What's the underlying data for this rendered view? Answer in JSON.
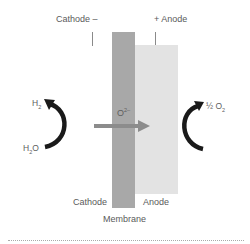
{
  "diagram": {
    "top_labels": {
      "cathode": "Cathode –",
      "anode": "+  Anode"
    },
    "bottom_labels": {
      "cathode": "Cathode",
      "anode": "Anode",
      "membrane": "Membrane"
    },
    "ion": {
      "base": "O",
      "charge": "2–"
    },
    "left_reaction": {
      "product_base": "H",
      "product_sub": "2",
      "reactant_base": "H",
      "reactant_sub": "2",
      "reactant_tail": "O"
    },
    "right_reaction": {
      "fraction": "½",
      "product_base": " O",
      "product_sub": "2"
    },
    "colors": {
      "membrane": "#a8a8a8",
      "anode": "#e3e3e3",
      "ion_arrow": "#8c8c8c",
      "reaction_arrows": "#1a1a1a"
    },
    "icons": [
      "curved-arrow-up-left",
      "curved-arrow-up-right",
      "ion-flow-arrow-right"
    ]
  }
}
